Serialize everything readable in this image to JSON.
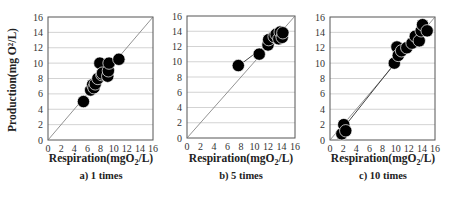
{
  "figure": {
    "shared_ylabel": "Production(mg O²/L)",
    "panels": [
      {
        "id": "a",
        "caption": "a) 1 times",
        "xlabel_main": "Respiration(mgO",
        "xlabel_sub": "2",
        "xlabel_end": "/L)"
      },
      {
        "id": "b",
        "caption": "b) 5 times",
        "xlabel_main": "Respiration(mgO",
        "xlabel_sub": "2",
        "xlabel_end": "/L)"
      },
      {
        "id": "c",
        "caption": "c) 10 times",
        "xlabel_main": "Respiration(mgO",
        "xlabel_sub": "2",
        "xlabel_end": "/L)"
      }
    ]
  },
  "chart_data": [
    {
      "type": "scatter",
      "title": "a) 1 times",
      "xlabel": "Respiration(mgO2/L)",
      "ylabel": "Production(mg O2/L)",
      "xlim": [
        0,
        16
      ],
      "ylim": [
        0,
        16
      ],
      "xticks": [
        0,
        2,
        4,
        6,
        8,
        10,
        12,
        14,
        16
      ],
      "yticks": [
        0,
        2,
        4,
        6,
        8,
        10,
        12,
        14,
        16
      ],
      "grid": "horizontal",
      "reference_line": "y = x",
      "series": [
        {
          "name": "samples",
          "x": [
            5.4,
            6.5,
            6.8,
            7.0,
            7.2,
            7.6,
            7.9,
            8.2,
            8.3,
            9.1,
            9.2,
            9.3,
            10.8
          ],
          "y": [
            5.0,
            6.5,
            7.2,
            6.8,
            7.3,
            8.0,
            10.0,
            8.5,
            8.7,
            8.3,
            9.0,
            10.0,
            10.5
          ]
        }
      ]
    },
    {
      "type": "scatter",
      "title": "b) 5 times",
      "xlabel": "Respiration(mgO2/L)",
      "ylabel": "Production(mg O2/L)",
      "xlim": [
        0,
        16
      ],
      "ylim": [
        0,
        16
      ],
      "xticks": [
        0,
        2,
        4,
        6,
        8,
        10,
        12,
        14,
        16
      ],
      "yticks": [
        0,
        2,
        4,
        6,
        8,
        10,
        12,
        14,
        16
      ],
      "grid": "horizontal",
      "reference_line": "y = x",
      "trend_line": true,
      "series": [
        {
          "name": "samples",
          "x": [
            7.6,
            10.7,
            12.0,
            12.1,
            12.9,
            13.2,
            13.6,
            13.8,
            14.1,
            14.2
          ],
          "y": [
            9.5,
            11.0,
            12.2,
            12.9,
            13.3,
            13.6,
            13.0,
            13.9,
            13.2,
            13.8
          ]
        }
      ]
    },
    {
      "type": "scatter",
      "title": "c) 10 times",
      "xlabel": "Respiration(mgO2/L)",
      "ylabel": "Production(mg O2/L)",
      "xlim": [
        0,
        16
      ],
      "ylim": [
        0,
        16
      ],
      "xticks": [
        0,
        2,
        4,
        6,
        8,
        10,
        12,
        14,
        16
      ],
      "yticks": [
        0,
        2,
        4,
        6,
        8,
        10,
        12,
        14,
        16
      ],
      "grid": "horizontal",
      "reference_line": "y = x",
      "trend_line": true,
      "series": [
        {
          "name": "samples",
          "x": [
            1.8,
            2.1,
            2.4,
            9.8,
            10.2,
            10.4,
            10.9,
            11.7,
            12.5,
            13.0,
            13.6,
            13.9,
            14.1,
            14.8
          ],
          "y": [
            0.8,
            2.0,
            1.2,
            10.0,
            12.1,
            11.0,
            11.6,
            12.0,
            12.6,
            13.5,
            12.9,
            14.2,
            15.0,
            14.2
          ]
        }
      ]
    }
  ]
}
